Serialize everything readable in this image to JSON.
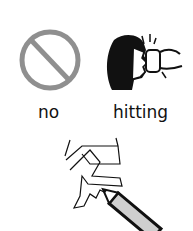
{
  "card": {
    "symbols": [
      {
        "id": "no",
        "icon": "prohibition-icon",
        "label": "no"
      },
      {
        "id": "hitting",
        "icon": "hitting-face-icon",
        "label": "hitting"
      }
    ],
    "drawing": {
      "icon": "pencil-scribble-icon"
    }
  },
  "colors": {
    "prohibition": "#8f8f8f",
    "ink": "#111111",
    "pencil_fill": "#cfcfcf"
  }
}
